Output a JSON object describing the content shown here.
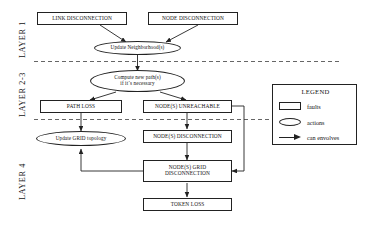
{
  "diagram": {
    "layers": [
      {
        "id": "layer1",
        "label": "LAYER 1"
      },
      {
        "id": "layer23",
        "label": "LAYER 2-3"
      },
      {
        "id": "layer4",
        "label": "LAYER 4"
      }
    ],
    "nodes": [
      {
        "id": "link-disconnection",
        "label": "LINK DISCONNECTION",
        "shape": "box",
        "kind": "fault"
      },
      {
        "id": "node-disconnection",
        "label": "NODE DISCONNECTION",
        "shape": "box",
        "kind": "fault"
      },
      {
        "id": "update-neighborhoods",
        "label": "Update Neighborhood(s)",
        "shape": "ellipse",
        "kind": "action"
      },
      {
        "id": "compute-new-paths",
        "label": "Compute new path(s)\nif it´s necessary",
        "line1": "Compute new path(s)",
        "line2": "if it´s necessary",
        "shape": "ellipse",
        "kind": "action"
      },
      {
        "id": "path-loss",
        "label": "PATH LOSS",
        "shape": "box",
        "kind": "fault"
      },
      {
        "id": "nodes-unreachable",
        "label": "NODE(S) UNREACHABLE",
        "shape": "box",
        "kind": "fault"
      },
      {
        "id": "update-grid-topology",
        "label": "Update GRID topology",
        "shape": "ellipse",
        "kind": "action"
      },
      {
        "id": "nodes-disconnection",
        "label": "NODE(S) DISCONNECTION",
        "shape": "box",
        "kind": "fault"
      },
      {
        "id": "nodes-grid-disconnection",
        "label": "NODE(S) GRID\nDISCONNECTION",
        "line1": "NODE(S) GRID",
        "line2": "DISCONNECTION",
        "shape": "box",
        "kind": "fault"
      },
      {
        "id": "token-loss",
        "label": "TOKEN LOSS",
        "shape": "box",
        "kind": "fault"
      }
    ],
    "edges": [
      {
        "from": "link-disconnection",
        "to": "update-neighborhoods"
      },
      {
        "from": "node-disconnection",
        "to": "update-neighborhoods"
      },
      {
        "from": "update-neighborhoods",
        "to": "compute-new-paths"
      },
      {
        "from": "compute-new-paths",
        "to": "path-loss"
      },
      {
        "from": "compute-new-paths",
        "to": "nodes-unreachable"
      },
      {
        "from": "path-loss",
        "to": "update-grid-topology"
      },
      {
        "from": "nodes-unreachable",
        "to": "nodes-disconnection"
      },
      {
        "from": "nodes-unreachable",
        "to": "nodes-grid-disconnection"
      },
      {
        "from": "nodes-disconnection",
        "to": "nodes-grid-disconnection"
      },
      {
        "from": "nodes-grid-disconnection",
        "to": "update-grid-topology"
      },
      {
        "from": "nodes-grid-disconnection",
        "to": "token-loss"
      }
    ]
  },
  "legend": {
    "title": "LEGEND",
    "items": [
      {
        "symbol": "rectangle",
        "label": "faults"
      },
      {
        "symbol": "ellipse",
        "label": "actions"
      },
      {
        "symbol": "arrow",
        "label": "can envolves"
      }
    ]
  },
  "colors": {
    "stroke": "#222222",
    "text": "#111111",
    "background": "#ffffff",
    "dashed_divider": "#555555"
  }
}
